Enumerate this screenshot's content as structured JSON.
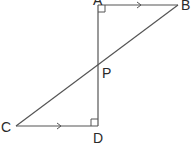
{
  "diagram": {
    "type": "geometry",
    "points": {
      "A": {
        "label": "A",
        "x": 98,
        "y": 5
      },
      "B": {
        "label": "B",
        "x": 178,
        "y": 5
      },
      "C": {
        "label": "C",
        "x": 16,
        "y": 126
      },
      "D": {
        "label": "D",
        "x": 98,
        "y": 126
      },
      "P": {
        "label": "P",
        "x": 98,
        "y": 64
      }
    },
    "segments": [
      "AB",
      "AD",
      "BC",
      "CD"
    ],
    "parallel_marks": [
      "AB",
      "CD"
    ],
    "right_angles": [
      "A",
      "D"
    ],
    "colors": {
      "line": "#555555",
      "text": "#2a2a2a",
      "background": "#ffffff"
    }
  }
}
